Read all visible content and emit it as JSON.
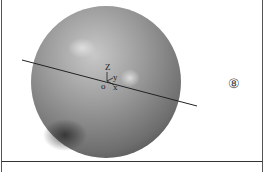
{
  "figure": {
    "number_label": "⑧",
    "axis_labels": {
      "z": "Z",
      "y": "y",
      "origin": "o",
      "x": "x"
    },
    "colors": {
      "sphere_light": "#c4c4c4",
      "sphere_mid": "#8a8a8a",
      "sphere_dark": "#3a3a3a",
      "line": "#222222",
      "border": "#555555"
    }
  }
}
